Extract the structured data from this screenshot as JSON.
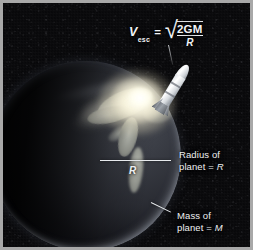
{
  "figure": {
    "background_color": "#0a0a0c",
    "frame_color": "#a8a8a8"
  },
  "formula": {
    "variable": "V",
    "subscript": "esc",
    "equals": "=",
    "radical_sign": "√",
    "numerator": "2GM",
    "denominator": "R",
    "plain_text": "V_esc = sqrt(2GM/R)"
  },
  "annotations": {
    "radius_line_label": "R",
    "radius_callout": "Radius of\nplanet = R",
    "radius_callout_line1": "Radius of",
    "radius_callout_line2_prefix": "planet = ",
    "radius_callout_line2_symbol": "R",
    "mass_callout": "Mass of\nplanet = M",
    "mass_callout_line1": "Mass of",
    "mass_callout_line2_prefix": "planet = ",
    "mass_callout_line2_symbol": "M",
    "label_color": "#eef0f2"
  },
  "scene": {
    "planet_name": "planet",
    "planet_color": "#3a3d45",
    "landmass_color": "#b9bcb4",
    "rocket_name": "rocket",
    "rocket_color": "#ffffff",
    "plume_color": "#fffce8",
    "shadow_color": "#000000"
  }
}
